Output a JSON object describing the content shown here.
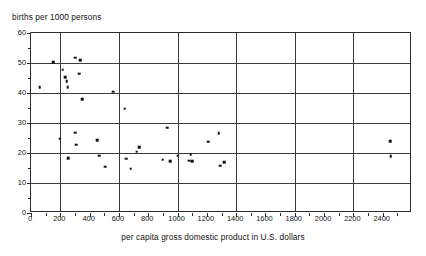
{
  "chart_data": {
    "type": "scatter",
    "title": "",
    "xlabel": "per capita gross domestic product in U.S. dollars",
    "ylabel": "births per 1000 persons",
    "xlim": [
      0,
      2600
    ],
    "ylim": [
      0,
      60
    ],
    "grid": true,
    "legend": null,
    "xticks": [
      0,
      200,
      400,
      600,
      800,
      1000,
      1200,
      1400,
      1600,
      1800,
      2000,
      2200,
      2400
    ],
    "xtick_labels": [
      "0",
      "200",
      "400",
      "600",
      "800",
      "1000",
      "1200",
      "1400",
      "1600",
      "1800",
      "2000",
      "2200",
      "2400"
    ],
    "xticks_minor": [
      100,
      300,
      500,
      700,
      900,
      1100,
      1300,
      1500,
      1700,
      1900,
      2100,
      2300,
      2500
    ],
    "yticks": [
      0,
      10,
      20,
      30,
      40,
      50,
      60
    ],
    "ytick_labels": [
      "0",
      "10",
      "20",
      "30",
      "40",
      "50",
      "60"
    ],
    "yticks_minor": [
      5,
      15,
      25,
      35,
      45,
      55
    ],
    "gridlines_x": [
      200,
      600,
      1000,
      1400,
      1800,
      2200
    ],
    "gridlines_y": [
      10,
      20,
      30,
      40,
      50
    ],
    "marker_color": "#111111",
    "marker_size": 2.6,
    "points": [
      {
        "x": 60,
        "y": 42.0
      },
      {
        "x": 150,
        "y": 50.3
      },
      {
        "x": 215,
        "y": 47.7
      },
      {
        "x": 235,
        "y": 45.3
      },
      {
        "x": 245,
        "y": 44.0
      },
      {
        "x": 250,
        "y": 41.9
      },
      {
        "x": 300,
        "y": 51.8
      },
      {
        "x": 335,
        "y": 51.0
      },
      {
        "x": 330,
        "y": 46.5
      },
      {
        "x": 350,
        "y": 38.0
      },
      {
        "x": 560,
        "y": 40.5
      },
      {
        "x": 640,
        "y": 34.8
      },
      {
        "x": 195,
        "y": 24.8
      },
      {
        "x": 255,
        "y": 18.3
      },
      {
        "x": 300,
        "y": 26.8
      },
      {
        "x": 310,
        "y": 22.7
      },
      {
        "x": 450,
        "y": 24.3
      },
      {
        "x": 465,
        "y": 19.1
      },
      {
        "x": 505,
        "y": 15.5
      },
      {
        "x": 650,
        "y": 18.1
      },
      {
        "x": 680,
        "y": 14.7
      },
      {
        "x": 720,
        "y": 20.4
      },
      {
        "x": 740,
        "y": 21.9
      },
      {
        "x": 900,
        "y": 17.8
      },
      {
        "x": 930,
        "y": 28.4
      },
      {
        "x": 950,
        "y": 17.3
      },
      {
        "x": 1000,
        "y": 19.1
      },
      {
        "x": 1080,
        "y": 17.5
      },
      {
        "x": 1090,
        "y": 19.4
      },
      {
        "x": 1100,
        "y": 17.2
      },
      {
        "x": 1210,
        "y": 23.8
      },
      {
        "x": 1280,
        "y": 26.6
      },
      {
        "x": 1290,
        "y": 15.8
      },
      {
        "x": 1320,
        "y": 17.0
      },
      {
        "x": 2450,
        "y": 23.9
      },
      {
        "x": 2455,
        "y": 18.9
      }
    ]
  }
}
